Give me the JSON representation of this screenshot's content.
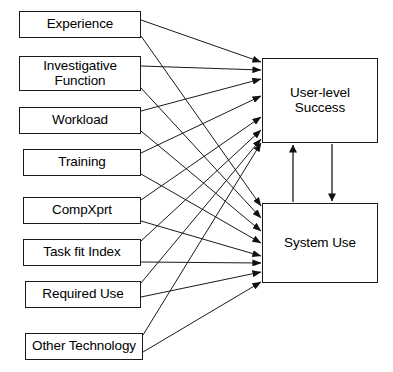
{
  "diagram": {
    "stroke_color": "#1a1a1a",
    "text_color": "#000000",
    "background_color": "#ffffff",
    "predictors": [
      {
        "id": "experience",
        "label": "Experience",
        "x": 19,
        "y": 11,
        "w": 122,
        "h": 27
      },
      {
        "id": "investigative",
        "label": "Investigative\nFunction",
        "x": 19,
        "y": 56,
        "w": 122,
        "h": 35
      },
      {
        "id": "workload",
        "label": "Workload",
        "x": 19,
        "y": 107,
        "w": 122,
        "h": 27
      },
      {
        "id": "training",
        "label": "Training",
        "x": 23,
        "y": 149,
        "w": 118,
        "h": 27
      },
      {
        "id": "compxprt",
        "label": "CompXprt",
        "x": 23,
        "y": 197,
        "w": 118,
        "h": 27
      },
      {
        "id": "task-fit-index",
        "label": "Task fit Index",
        "x": 23,
        "y": 239,
        "w": 118,
        "h": 27
      },
      {
        "id": "required-use",
        "label": "Required Use",
        "x": 25,
        "y": 281,
        "w": 116,
        "h": 27
      },
      {
        "id": "other-technology",
        "label": "Other Technology",
        "x": 25,
        "y": 333,
        "w": 118,
        "h": 27
      }
    ],
    "outcomes": [
      {
        "id": "user-level-success",
        "label": "User-level Success",
        "x": 262,
        "y": 58,
        "w": 116,
        "h": 85
      },
      {
        "id": "system-use",
        "label": "System Use",
        "x": 262,
        "y": 203,
        "w": 116,
        "h": 80
      }
    ],
    "edges": [
      {
        "from": "experience",
        "to": "user-level-success",
        "x1": 141,
        "y1": 20,
        "x2": 261,
        "y2": 62
      },
      {
        "from": "experience",
        "to": "system-use",
        "x1": 141,
        "y1": 36,
        "x2": 261,
        "y2": 206
      },
      {
        "from": "investigative",
        "to": "user-level-success",
        "x1": 141,
        "y1": 66,
        "x2": 261,
        "y2": 70
      },
      {
        "from": "investigative",
        "to": "system-use",
        "x1": 141,
        "y1": 88,
        "x2": 261,
        "y2": 218
      },
      {
        "from": "workload",
        "to": "user-level-success",
        "x1": 141,
        "y1": 111,
        "x2": 261,
        "y2": 79
      },
      {
        "from": "workload",
        "to": "system-use",
        "x1": 141,
        "y1": 131,
        "x2": 261,
        "y2": 231
      },
      {
        "from": "training",
        "to": "user-level-success",
        "x1": 141,
        "y1": 153,
        "x2": 261,
        "y2": 96
      },
      {
        "from": "training",
        "to": "system-use",
        "x1": 141,
        "y1": 174,
        "x2": 261,
        "y2": 243
      },
      {
        "from": "compxprt",
        "to": "user-level-success",
        "x1": 141,
        "y1": 200,
        "x2": 261,
        "y2": 117
      },
      {
        "from": "compxprt",
        "to": "system-use",
        "x1": 141,
        "y1": 221,
        "x2": 261,
        "y2": 256
      },
      {
        "from": "task-fit-index",
        "to": "user-level-success",
        "x1": 141,
        "y1": 241,
        "x2": 261,
        "y2": 130
      },
      {
        "from": "task-fit-index",
        "to": "system-use",
        "x1": 141,
        "y1": 262,
        "x2": 261,
        "y2": 263
      },
      {
        "from": "required-use",
        "to": "user-level-success",
        "x1": 141,
        "y1": 283,
        "x2": 261,
        "y2": 139
      },
      {
        "from": "required-use",
        "to": "system-use",
        "x1": 141,
        "y1": 297,
        "x2": 261,
        "y2": 272
      },
      {
        "from": "other-technology",
        "to": "user-level-success",
        "x1": 143,
        "y1": 335,
        "x2": 261,
        "y2": 143
      },
      {
        "from": "other-technology",
        "to": "system-use",
        "x1": 143,
        "y1": 352,
        "x2": 261,
        "y2": 282
      }
    ],
    "reciprocal_edges": [
      {
        "id": "system-use-to-success",
        "from": "system-use",
        "to": "user-level-success",
        "x1": 293,
        "y1": 202,
        "x2": 293,
        "y2": 145,
        "direction": "up"
      },
      {
        "id": "success-to-system-use",
        "from": "user-level-success",
        "to": "system-use",
        "x1": 332,
        "y1": 144,
        "x2": 332,
        "y2": 201,
        "direction": "down"
      }
    ]
  }
}
